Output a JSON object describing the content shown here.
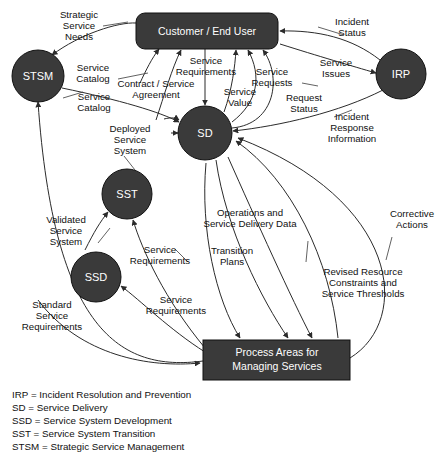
{
  "diagram": {
    "colors": {
      "node_fill": "#3a3a3a",
      "node_stroke": "#111111",
      "node_label": "#ffffff",
      "edge": "#2b2b2b",
      "leader": "#3a3a3a",
      "text": "#111111",
      "background": "#ffffff"
    },
    "nodes": [
      {
        "id": "customer",
        "label": "Customer / End User",
        "shape": "rounded-rect"
      },
      {
        "id": "stsm",
        "label": "STSM",
        "shape": "circle"
      },
      {
        "id": "irp",
        "label": "IRP",
        "shape": "circle"
      },
      {
        "id": "sd",
        "label": "SD",
        "shape": "circle"
      },
      {
        "id": "sst",
        "label": "SST",
        "shape": "circle"
      },
      {
        "id": "ssd",
        "label": "SSD",
        "shape": "circle"
      },
      {
        "id": "process_areas",
        "label_line1": "Process Areas for",
        "label_line2": "Managing Services",
        "shape": "rect"
      }
    ],
    "edge_labels": {
      "strategic_service_needs": {
        "line1": "Strategic",
        "line2": "Service",
        "line3": "Needs"
      },
      "service_catalog_top": {
        "line1": "Service",
        "line2": "Catalog"
      },
      "service_catalog_bottom": {
        "line1": "Service",
        "line2": "Catalog"
      },
      "contract_service_agreement": {
        "line1": "Contract / Service",
        "line2": "Agreement"
      },
      "service_requirements_top": {
        "line1": "Service",
        "line2": "Requirements"
      },
      "service_value": {
        "line1": "Service",
        "line2": "Value"
      },
      "service_requests": {
        "line1": "Service",
        "line2": "Requests"
      },
      "request_status": {
        "line1": "Request",
        "line2": "Status"
      },
      "incident_status": {
        "line1": "Incident",
        "line2": "Status"
      },
      "service_issues": {
        "line1": "Service",
        "line2": "Issues"
      },
      "incident_response_information": {
        "line1": "Incident",
        "line2": "Response",
        "line3": "Information"
      },
      "deployed_service_system": {
        "line1": "Deployed",
        "line2": "Service",
        "line3": "System"
      },
      "validated_service_system": {
        "line1": "Validated",
        "line2": "Service",
        "line3": "System"
      },
      "service_requirements_sst": {
        "line1": "Service",
        "line2": "Requirements"
      },
      "service_requirements_ssd": {
        "line1": "Service",
        "line2": "Requirements"
      },
      "standard_service_requirements": {
        "line1": "Standard",
        "line2": "Service",
        "line3": "Requirements"
      },
      "transition_plans": {
        "line1": "Transition",
        "line2": "Plans"
      },
      "operations_and_service_delivery_data": {
        "line1": "Operations and",
        "line2": "Service Delivery Data"
      },
      "revised_resource_constraints": {
        "line1": "Revised Resource",
        "line2": "Constraints and",
        "line3": "Service Thresholds"
      },
      "corrective_actions": {
        "line1": "Corrective",
        "line2": "Actions"
      }
    },
    "legend": [
      "IRP = Incident Resolution and Prevention",
      "SD = Service Delivery",
      "SSD = Service System Development",
      "SST = Service System Transition",
      "STSM = Strategic Service Management"
    ]
  }
}
